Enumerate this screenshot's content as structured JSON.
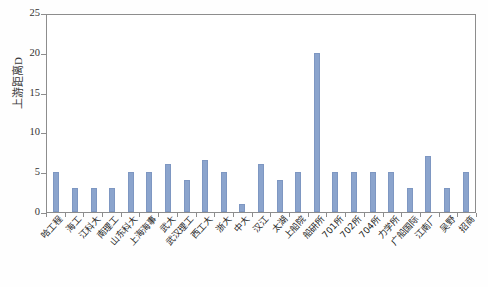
{
  "chart_data": {
    "type": "bar",
    "title": "",
    "xlabel": "",
    "ylabel": "上游距离D",
    "ylim": [
      0,
      25
    ],
    "ytick_labels": [
      "0",
      "5",
      "10",
      "15",
      "20",
      "25"
    ],
    "yticks": [
      0,
      5,
      10,
      15,
      20,
      25
    ],
    "grid": false,
    "legend": "none",
    "bar_color": "#8ba4cd",
    "axis_color": "#8d8d8d",
    "categories": [
      "哈工程",
      "海工",
      "江科大",
      "南理工",
      "山东科大",
      "上海海事",
      "武大",
      "武汉理工",
      "西工大",
      "浙大",
      "中大",
      "汉江",
      "太湖",
      "上船院",
      "船研所",
      "701所",
      "702所",
      "704所",
      "力学所",
      "广船国际",
      "江南厂",
      "吴野",
      "招商"
    ],
    "values": [
      5,
      3,
      3,
      3,
      5,
      5,
      6,
      4,
      6.5,
      5,
      1,
      6,
      4,
      5,
      20,
      5,
      5,
      5,
      5,
      3,
      7,
      3,
      5
    ]
  }
}
